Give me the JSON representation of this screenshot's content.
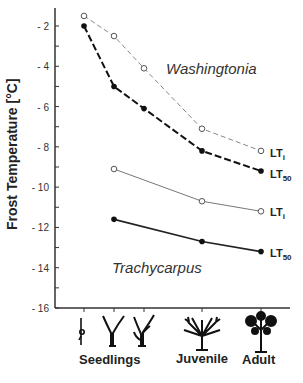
{
  "chart_data": {
    "type": "line",
    "title": "",
    "xlabel": "",
    "ylabel": "Frost Temperature [°C]",
    "ylim": [
      -16,
      -1
    ],
    "yticks": [
      -2,
      -4,
      -6,
      -8,
      -10,
      -12,
      -14,
      -16
    ],
    "ytick_labels": [
      "- 2",
      "- 4",
      "- 6",
      "- 8",
      "- 10",
      "- 12",
      "- 14",
      "- 16"
    ],
    "x_stages": [
      "Seedling 1",
      "Seedling 2",
      "Seedling 3",
      "Juvenile",
      "Adult"
    ],
    "x_group_labels": [
      "Seedlings",
      "Juvenile",
      "Adult"
    ],
    "grid": false,
    "series": [
      {
        "name": "Washingtonia LTi",
        "species": "Washingtonia",
        "marker": "open-circle",
        "line": "dashed-thin-gray",
        "x": [
          1,
          2,
          3,
          4,
          5
        ],
        "values": [
          -1.5,
          -2.5,
          -4.1,
          -7.1,
          -8.2
        ]
      },
      {
        "name": "Washingtonia LT50",
        "species": "Washingtonia",
        "marker": "filled-circle",
        "line": "dashed-thick-black",
        "x": [
          1,
          2,
          3,
          4,
          5
        ],
        "values": [
          -2.0,
          -5.0,
          -6.1,
          -8.2,
          -9.2
        ]
      },
      {
        "name": "Trachycarpus LTi",
        "species": "Trachycarpus",
        "marker": "open-circle",
        "line": "solid-thin-gray",
        "x": [
          2,
          4,
          5
        ],
        "values": [
          -9.1,
          -10.7,
          -11.2
        ]
      },
      {
        "name": "Trachycarpus LT50",
        "species": "Trachycarpus",
        "marker": "filled-circle",
        "line": "solid-black",
        "x": [
          2,
          4,
          5
        ],
        "values": [
          -11.6,
          -12.7,
          -13.2
        ]
      }
    ],
    "annotations": [
      "Washingtonia",
      "Trachycarpus",
      "LTi",
      "LT50",
      "LTi",
      "LT50"
    ]
  },
  "labels": {
    "ylabel": "Frost Temperature [°C]",
    "species_top": "Washingtonia",
    "species_bottom": "Trachycarpus",
    "lt_main": "LT",
    "lt_i_sub": "i",
    "lt_50_sub": "50",
    "x_seedlings": "Seedlings",
    "x_juvenile": "Juvenile",
    "x_adult": "Adult"
  },
  "icons": [
    "seedling-sprout-icon",
    "seedling-two-leaf-icon",
    "seedling-fan-icon",
    "juvenile-palm-icon",
    "adult-palm-tree-icon"
  ]
}
